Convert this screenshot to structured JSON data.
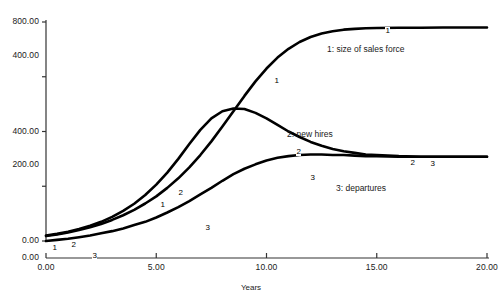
{
  "chart_data": {
    "type": "line",
    "title": "",
    "xlabel": "Years",
    "ylabel": "",
    "grid": false,
    "legend_position": "inline-annotations",
    "xlim": [
      0.0,
      20.0
    ],
    "x_ticks": [
      "0.00",
      "5.00",
      "10.00",
      "15.00",
      "20.00"
    ],
    "x_tick_values": [
      0,
      5,
      10,
      15,
      20
    ],
    "axes": [
      {
        "name": "left-outer",
        "ylim": [
          0.0,
          800.0
        ],
        "ticks": [
          "800.00",
          "400.00",
          "0.00"
        ],
        "tick_values": [
          800,
          400,
          0
        ],
        "applies_to": [
          "1: size of sales force"
        ]
      },
      {
        "name": "left-inner",
        "ylim": [
          0.0,
          400.0
        ],
        "ticks": [
          "400.00",
          "200.00",
          "0.00"
        ],
        "tick_values": [
          400,
          200,
          0
        ],
        "applies_to": [
          "2: new hires",
          "3: departures"
        ]
      }
    ],
    "series": [
      {
        "id": "1",
        "name": "1: size of sales force",
        "axis": "left-outer",
        "marker_label": "1",
        "x": [
          0.0,
          0.5,
          1.0,
          1.5,
          2.0,
          2.5,
          3.0,
          3.5,
          4.0,
          4.5,
          5.0,
          5.5,
          6.0,
          6.5,
          7.0,
          7.5,
          8.0,
          8.5,
          9.0,
          9.5,
          10.0,
          10.5,
          11.0,
          11.5,
          12.0,
          12.5,
          13.0,
          13.5,
          14.0,
          14.5,
          15.0,
          16.0,
          17.0,
          18.0,
          19.0,
          20.0
        ],
        "y": [
          18,
          24,
          31,
          40,
          50,
          62,
          77,
          94,
          114,
          137,
          163,
          194,
          229,
          269,
          314,
          364,
          418,
          474,
          530,
          583,
          630,
          670,
          702,
          727,
          745,
          758,
          766,
          772,
          775,
          777,
          778,
          779,
          779,
          780,
          780,
          780
        ]
      },
      {
        "id": "2",
        "name": "2: new hires",
        "axis": "left-inner",
        "marker_label": "2",
        "x": [
          0.0,
          0.5,
          1.0,
          1.5,
          2.0,
          2.5,
          3.0,
          3.5,
          4.0,
          4.5,
          5.0,
          5.5,
          6.0,
          6.5,
          7.0,
          7.5,
          8.0,
          8.5,
          9.0,
          9.5,
          10.0,
          10.5,
          11.0,
          11.5,
          12.0,
          12.5,
          13.0,
          13.5,
          14.0,
          14.5,
          15.0,
          16.0,
          17.0,
          18.0,
          19.0,
          20.0
        ],
        "y": [
          10,
          13,
          17,
          22,
          28,
          35,
          44,
          55,
          68,
          84,
          103,
          125,
          150,
          177,
          203,
          224,
          237,
          242,
          241,
          234,
          224,
          212,
          200,
          190,
          181,
          174,
          168,
          164,
          161,
          158,
          157,
          155,
          154,
          154,
          154,
          154
        ]
      },
      {
        "id": "3",
        "name": "3: departures",
        "axis": "left-inner",
        "marker_label": "3",
        "x": [
          0.0,
          0.5,
          1.0,
          1.5,
          2.0,
          2.5,
          3.0,
          3.5,
          4.0,
          4.5,
          5.0,
          5.5,
          6.0,
          6.5,
          7.0,
          7.5,
          8.0,
          8.5,
          9.0,
          9.5,
          10.0,
          10.5,
          11.0,
          11.5,
          12.0,
          12.5,
          13.0,
          13.5,
          14.0,
          14.5,
          15.0,
          16.0,
          17.0,
          18.0,
          19.0,
          20.0
        ],
        "y": [
          0,
          2,
          4,
          7,
          10,
          14,
          18,
          23,
          29,
          35,
          43,
          52,
          62,
          73,
          85,
          97,
          110,
          122,
          132,
          140,
          147,
          152,
          155,
          157,
          158,
          158,
          157,
          157,
          156,
          155,
          155,
          154,
          154,
          154,
          154,
          154
        ]
      }
    ],
    "annotations": [
      {
        "text": "1: size of sales force",
        "x_px": 327,
        "y_px": 44
      },
      {
        "text": "2: new hires",
        "x_px": 287,
        "y_px": 129
      },
      {
        "text": "3: departures",
        "x_px": 336,
        "y_px": 183
      }
    ],
    "series_markers": [
      {
        "label": "1",
        "x_px": 52,
        "y_px": 244
      },
      {
        "label": "1",
        "x_px": 160,
        "y_px": 201
      },
      {
        "label": "1",
        "x_px": 274,
        "y_px": 77
      },
      {
        "label": "1",
        "x_px": 385,
        "y_px": 27
      },
      {
        "label": "2",
        "x_px": 71,
        "y_px": 241
      },
      {
        "label": "2",
        "x_px": 178,
        "y_px": 189
      },
      {
        "label": "2",
        "x_px": 296,
        "y_px": 148
      },
      {
        "label": "2",
        "x_px": 410,
        "y_px": 159
      },
      {
        "label": "3",
        "x_px": 92,
        "y_px": 252
      },
      {
        "label": "3",
        "x_px": 205,
        "y_px": 224
      },
      {
        "label": "3",
        "x_px": 310,
        "y_px": 174
      },
      {
        "label": "3",
        "x_px": 430,
        "y_px": 160
      }
    ],
    "colors": {
      "line": "#000000",
      "axis": "#333333",
      "text": "#1a1a1a",
      "background": "#ffffff"
    }
  }
}
